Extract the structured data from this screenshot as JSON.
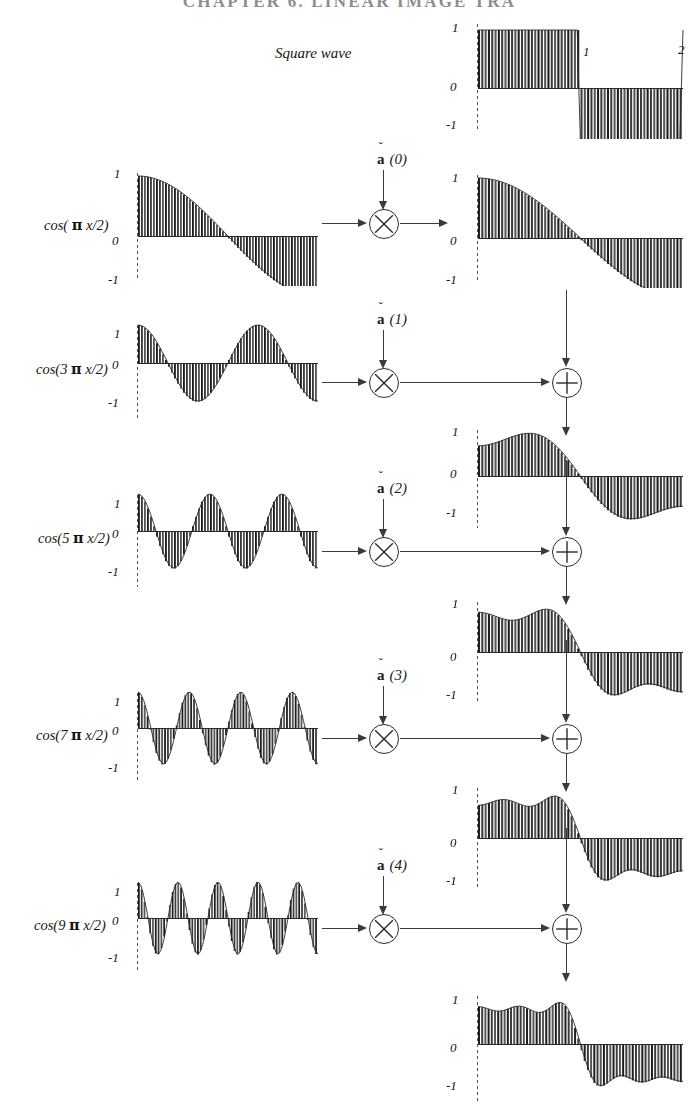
{
  "runhead": "CHAPTER  6.   LINEAR IMAGE TRA",
  "figure": {
    "title": "Square wave",
    "axis_ticks": {
      "top": "1",
      "zero": "0",
      "bottom": "-1"
    },
    "x_ticks": [
      {
        "label": "1",
        "x": 0.5
      },
      {
        "label": "2",
        "x": 1.0
      }
    ]
  },
  "basis_rows": [
    {
      "label_prefix": "cos( ",
      "label_pi": "π",
      "label_suffix": " x/2)",
      "harmonic": 1,
      "coefficient_label": {
        "caron": "ˇ",
        "symbol": "a",
        "index": "(0)"
      },
      "product_op": "multiply",
      "sum_op": null
    },
    {
      "label_prefix": "cos(3 ",
      "label_pi": "π",
      "label_suffix": " x/2)",
      "harmonic": 3,
      "coefficient_label": {
        "caron": "ˇ",
        "symbol": "a",
        "index": "(1)"
      },
      "product_op": "multiply",
      "sum_op": "add"
    },
    {
      "label_prefix": "cos(5 ",
      "label_pi": "π",
      "label_suffix": " x/2)",
      "harmonic": 5,
      "coefficient_label": {
        "caron": "ˇ",
        "symbol": "a",
        "index": "(2)"
      },
      "product_op": "multiply",
      "sum_op": "add"
    },
    {
      "label_prefix": "cos(7 ",
      "label_pi": "π",
      "label_suffix": " x/2)",
      "harmonic": 7,
      "coefficient_label": {
        "caron": "ˇ",
        "symbol": "a",
        "index": "(3)"
      },
      "product_op": "multiply",
      "sum_op": "add"
    },
    {
      "label_prefix": "cos(9 ",
      "label_pi": "π",
      "label_suffix": " x/2)",
      "harmonic": 9,
      "coefficient_label": {
        "caron": "ˇ",
        "symbol": "a",
        "index": "(4)"
      },
      "product_op": "multiply",
      "sum_op": "add"
    }
  ],
  "operators": {
    "multiply_glyph": "⊗",
    "add_glyph": "⊕"
  },
  "chart_data": {
    "type": "bar",
    "title": "Square wave",
    "xlabel": "",
    "ylabel": "",
    "ylim": [
      -1.35,
      1.35
    ],
    "xlim": [
      0,
      2
    ],
    "grid": false,
    "legend": null,
    "ytick_labels": [
      "1",
      "0",
      "-1"
    ],
    "ytick_values": [
      1,
      0,
      -1
    ],
    "xtick_labels": [
      "1",
      "2"
    ],
    "xtick_values": [
      1,
      2
    ],
    "sample_count": 64,
    "panels": [
      {
        "name": "square-wave",
        "role": "target-signal",
        "column": "right",
        "row": 0,
        "formula": "sq(x) = +1 for 0<=x<1, -1 for 1<=x<2",
        "values_note": "ideal square wave, amplitude 1"
      },
      {
        "name": "basis-cos-1",
        "role": "basis-function",
        "column": "left",
        "row": 1,
        "formula": "cos(1*pi*x/2)",
        "harmonic": 1,
        "amplitude": 1
      },
      {
        "name": "scaled-cos-1",
        "role": "scaled-basis",
        "column": "right",
        "row": 1,
        "formula": "a(0)*cos(1*pi*x/2)",
        "harmonic": 1,
        "amplitude": 1.0
      },
      {
        "name": "basis-cos-3",
        "role": "basis-function",
        "column": "left",
        "row": 2,
        "formula": "cos(3*pi*x/2)",
        "harmonic": 3,
        "amplitude": 1
      },
      {
        "name": "partial-sum-1",
        "role": "partial-sum",
        "column": "right",
        "row": 2,
        "formula": "sum k=0..1 of a(k)*cos((2k+1)*pi*x/2)",
        "terms": 2
      },
      {
        "name": "basis-cos-5",
        "role": "basis-function",
        "column": "left",
        "row": 3,
        "formula": "cos(5*pi*x/2)",
        "harmonic": 5,
        "amplitude": 1
      },
      {
        "name": "partial-sum-2",
        "role": "partial-sum",
        "column": "right",
        "row": 3,
        "formula": "sum k=0..2 of a(k)*cos((2k+1)*pi*x/2)",
        "terms": 3
      },
      {
        "name": "basis-cos-7",
        "role": "basis-function",
        "column": "left",
        "row": 4,
        "formula": "cos(7*pi*x/2)",
        "harmonic": 7,
        "amplitude": 1
      },
      {
        "name": "partial-sum-3",
        "role": "partial-sum",
        "column": "right",
        "row": 4,
        "formula": "sum k=0..3 of a(k)*cos((2k+1)*pi*x/2)",
        "terms": 4
      },
      {
        "name": "basis-cos-9",
        "role": "basis-function",
        "column": "left",
        "row": 5,
        "formula": "cos(9*pi*x/2)",
        "harmonic": 9,
        "amplitude": 1
      },
      {
        "name": "partial-sum-4",
        "role": "partial-sum",
        "column": "right",
        "row": 5,
        "formula": "sum k=0..4 of a(k)*cos((2k+1)*pi*x/2)",
        "terms": 5
      }
    ],
    "fourier_coefficients": [
      {
        "index": 0,
        "harmonic": 1,
        "value": 1.273
      },
      {
        "index": 1,
        "harmonic": 3,
        "value": -0.424
      },
      {
        "index": 2,
        "harmonic": 5,
        "value": 0.255
      },
      {
        "index": 3,
        "harmonic": 7,
        "value": -0.182
      },
      {
        "index": 4,
        "harmonic": 9,
        "value": 0.141
      }
    ]
  }
}
